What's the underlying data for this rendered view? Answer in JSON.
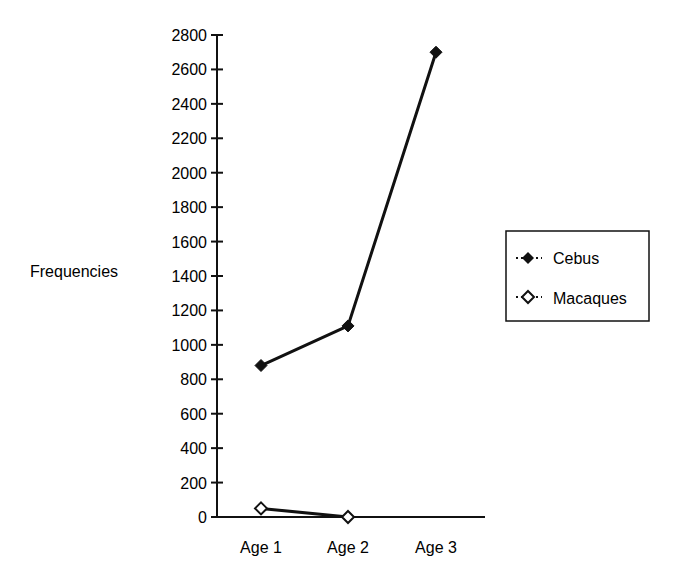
{
  "chart_data": {
    "type": "line",
    "title": "",
    "xlabel": "",
    "ylabel": "Frequencies",
    "categories": [
      "Age 1",
      "Age 2",
      "Age 3"
    ],
    "series": [
      {
        "name": "Cebus",
        "marker": "filled-diamond",
        "values": [
          880,
          1110,
          2700
        ]
      },
      {
        "name": "Macaques",
        "marker": "open-diamond",
        "values": [
          50,
          0,
          null
        ]
      }
    ],
    "ylim": [
      0,
      2800
    ],
    "yticks": [
      0,
      200,
      400,
      600,
      800,
      1000,
      1200,
      1400,
      1600,
      1800,
      2000,
      2200,
      2400,
      2600,
      2800
    ],
    "grid": false,
    "legend_position": "right",
    "colors": {
      "line": "#111111",
      "background": "#ffffff"
    }
  },
  "legend": {
    "items": [
      {
        "label": "Cebus"
      },
      {
        "label": "Macaques"
      }
    ]
  }
}
